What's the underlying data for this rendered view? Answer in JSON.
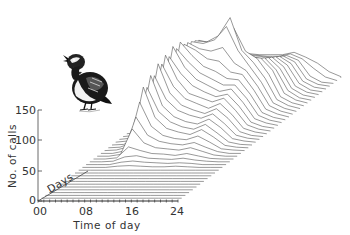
{
  "chart_data": {
    "type": "waterfall-3d-line",
    "title": "",
    "xlabel": "Time of day",
    "ylabel": "No. of calls",
    "zlabel": "Days",
    "x_ticks": [
      "00",
      "08",
      "16",
      "24"
    ],
    "y_ticks": [
      "0",
      "50",
      "100",
      "150"
    ],
    "xlim": [
      0,
      24
    ],
    "ylim": [
      0,
      150
    ],
    "grid": false,
    "legend": null,
    "illustration": "quail-bird",
    "x": [
      0,
      2,
      4,
      6,
      8,
      10,
      12,
      14,
      16,
      18,
      20,
      22,
      24
    ],
    "series": [
      {
        "day": 1,
        "values": [
          0,
          0,
          0,
          0,
          0,
          0,
          0,
          0,
          0,
          0,
          0,
          0,
          0
        ]
      },
      {
        "day": 2,
        "values": [
          0,
          0,
          0,
          0,
          0,
          0,
          0,
          0,
          0,
          0,
          0,
          0,
          0
        ]
      },
      {
        "day": 3,
        "values": [
          0,
          0,
          0,
          0,
          0,
          0,
          0,
          0,
          0,
          0,
          0,
          0,
          0
        ]
      },
      {
        "day": 4,
        "values": [
          0,
          0,
          0,
          0,
          0,
          0,
          0,
          0,
          0,
          0,
          0,
          0,
          0
        ]
      },
      {
        "day": 5,
        "values": [
          0,
          0,
          0,
          0,
          0,
          0,
          0,
          0,
          0,
          0,
          0,
          0,
          0
        ]
      },
      {
        "day": 6,
        "values": [
          0,
          0,
          0,
          0,
          0,
          0,
          0,
          0,
          0,
          0,
          0,
          0,
          0
        ]
      },
      {
        "day": 7,
        "values": [
          0,
          0,
          0,
          0,
          0,
          0,
          0,
          0,
          0,
          0,
          0,
          0,
          0
        ]
      },
      {
        "day": 8,
        "values": [
          0,
          0,
          0,
          0,
          0,
          0,
          0,
          0,
          0,
          0,
          0,
          0,
          0
        ]
      },
      {
        "day": 9,
        "values": [
          0,
          0,
          0,
          0,
          0,
          0,
          0,
          0,
          0,
          0,
          0,
          0,
          0
        ]
      },
      {
        "day": 10,
        "values": [
          0,
          0,
          0,
          0,
          0,
          0,
          0,
          0,
          0,
          0,
          0,
          0,
          0
        ]
      },
      {
        "day": 11,
        "values": [
          0,
          0,
          0,
          0,
          0,
          0,
          0,
          0,
          0,
          0,
          0,
          0,
          0
        ]
      },
      {
        "day": 12,
        "values": [
          0,
          0,
          0,
          0,
          0,
          0,
          0,
          0,
          0,
          0,
          0,
          0,
          0
        ]
      },
      {
        "day": 13,
        "values": [
          0,
          0,
          0,
          2,
          3,
          2,
          1,
          1,
          2,
          1,
          0,
          0,
          0
        ]
      },
      {
        "day": 14,
        "values": [
          0,
          0,
          0,
          4,
          6,
          4,
          3,
          2,
          3,
          2,
          0,
          0,
          0
        ]
      },
      {
        "day": 15,
        "values": [
          0,
          0,
          1,
          8,
          10,
          6,
          5,
          4,
          6,
          3,
          1,
          0,
          0
        ]
      },
      {
        "day": 16,
        "values": [
          0,
          0,
          2,
          20,
          14,
          9,
          8,
          6,
          9,
          5,
          1,
          0,
          0
        ]
      },
      {
        "day": 17,
        "values": [
          0,
          0,
          3,
          45,
          22,
          14,
          12,
          10,
          14,
          8,
          2,
          0,
          0
        ]
      },
      {
        "day": 18,
        "values": [
          0,
          0,
          4,
          60,
          30,
          20,
          16,
          14,
          18,
          10,
          3,
          0,
          0
        ]
      },
      {
        "day": 19,
        "values": [
          0,
          1,
          6,
          80,
          40,
          25,
          20,
          18,
          24,
          14,
          3,
          1,
          0
        ]
      },
      {
        "day": 20,
        "values": [
          0,
          1,
          8,
          100,
          50,
          32,
          26,
          22,
          30,
          18,
          4,
          1,
          0
        ]
      },
      {
        "day": 21,
        "values": [
          0,
          1,
          10,
          95,
          55,
          38,
          30,
          26,
          34,
          20,
          5,
          1,
          0
        ]
      },
      {
        "day": 22,
        "values": [
          0,
          2,
          12,
          110,
          60,
          42,
          34,
          30,
          38,
          24,
          6,
          2,
          0
        ]
      },
      {
        "day": 23,
        "values": [
          0,
          2,
          14,
          105,
          66,
          48,
          40,
          35,
          42,
          26,
          7,
          2,
          0
        ]
      },
      {
        "day": 24,
        "values": [
          0,
          2,
          16,
          120,
          72,
          52,
          44,
          38,
          46,
          30,
          8,
          2,
          0
        ]
      },
      {
        "day": 25,
        "values": [
          0,
          3,
          18,
          115,
          78,
          58,
          50,
          42,
          50,
          32,
          9,
          3,
          0
        ]
      },
      {
        "day": 26,
        "values": [
          0,
          3,
          20,
          125,
          85,
          62,
          55,
          48,
          54,
          34,
          10,
          3,
          0
        ]
      },
      {
        "day": 27,
        "values": [
          0,
          3,
          22,
          118,
          90,
          70,
          60,
          52,
          56,
          36,
          10,
          3,
          0
        ]
      },
      {
        "day": 28,
        "values": [
          0,
          4,
          24,
          130,
          96,
          76,
          66,
          56,
          60,
          38,
          11,
          4,
          0
        ]
      },
      {
        "day": 29,
        "values": [
          0,
          4,
          26,
          122,
          100,
          82,
          72,
          62,
          62,
          40,
          12,
          4,
          0
        ]
      },
      {
        "day": 30,
        "values": [
          0,
          4,
          28,
          128,
          106,
          88,
          80,
          68,
          66,
          42,
          12,
          4,
          0
        ]
      },
      {
        "day": 31,
        "values": [
          0,
          5,
          30,
          120,
          110,
          96,
          92,
          74,
          70,
          44,
          13,
          5,
          0
        ]
      },
      {
        "day": 32,
        "values": [
          0,
          5,
          30,
          118,
          108,
          104,
          110,
          84,
          72,
          46,
          14,
          5,
          0
        ]
      },
      {
        "day": 33,
        "values": [
          0,
          5,
          32,
          115,
          112,
          118,
          140,
          100,
          74,
          48,
          14,
          5,
          0
        ]
      },
      {
        "day": 34,
        "values": [
          0,
          5,
          32,
          112,
          110,
          120,
          150,
          96,
          76,
          50,
          15,
          5,
          0
        ]
      },
      {
        "day": 35,
        "values": [
          0,
          5,
          30,
          108,
          104,
          112,
          128,
          90,
          78,
          52,
          15,
          5,
          0
        ]
      },
      {
        "day": 36,
        "values": [
          0,
          5,
          28,
          100,
          96,
          90,
          80,
          76,
          74,
          54,
          16,
          5,
          0
        ]
      },
      {
        "day": 37,
        "values": [
          0,
          4,
          26,
          90,
          86,
          78,
          70,
          66,
          70,
          50,
          16,
          4,
          0
        ]
      },
      {
        "day": 38,
        "values": [
          0,
          4,
          24,
          82,
          78,
          70,
          64,
          60,
          66,
          48,
          15,
          4,
          0
        ]
      },
      {
        "day": 39,
        "values": [
          0,
          4,
          22,
          74,
          70,
          64,
          58,
          56,
          62,
          46,
          14,
          4,
          0
        ]
      },
      {
        "day": 40,
        "values": [
          0,
          3,
          20,
          66,
          64,
          58,
          54,
          52,
          58,
          44,
          14,
          3,
          0
        ]
      },
      {
        "day": 41,
        "values": [
          0,
          3,
          18,
          60,
          58,
          54,
          50,
          48,
          54,
          42,
          13,
          3,
          0
        ]
      },
      {
        "day": 42,
        "values": [
          0,
          3,
          16,
          54,
          52,
          50,
          46,
          46,
          50,
          40,
          12,
          3,
          0
        ]
      },
      {
        "day": 43,
        "values": [
          0,
          2,
          14,
          48,
          48,
          46,
          44,
          42,
          46,
          38,
          12,
          2,
          0
        ]
      },
      {
        "day": 44,
        "values": [
          0,
          2,
          12,
          44,
          44,
          42,
          40,
          40,
          44,
          36,
          20,
          6,
          0
        ]
      },
      {
        "day": 45,
        "values": [
          0,
          2,
          10,
          40,
          40,
          38,
          38,
          38,
          42,
          34,
          24,
          10,
          2
        ]
      }
    ]
  },
  "axes": {
    "x_title": "Time of day",
    "y_title": "No. of calls",
    "z_title": "Days",
    "x_tick_labels": [
      "00",
      "08",
      "16",
      "24"
    ],
    "y_tick_labels": [
      "0",
      "50",
      "100",
      "150"
    ]
  }
}
